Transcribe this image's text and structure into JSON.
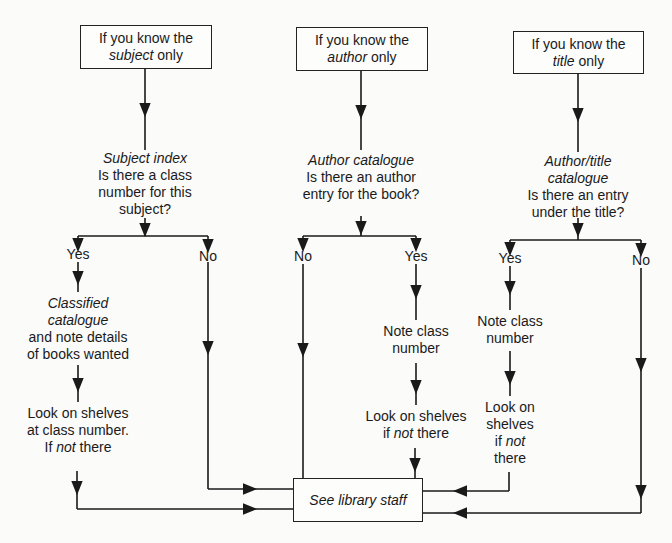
{
  "diagram": {
    "type": "flowchart",
    "start_nodes": [
      {
        "id": "subject",
        "line1": "If you know the",
        "emph": "subject",
        "rest": " only"
      },
      {
        "id": "author",
        "line1": "If you know the",
        "emph": "author",
        "rest": " only"
      },
      {
        "id": "title",
        "line1": "If you know the",
        "emph": "title",
        "rest": " only"
      }
    ],
    "questions": [
      {
        "id": "subject-index",
        "heading": "Subject index",
        "lines": [
          "Is there a class",
          "number for this",
          "subject?"
        ]
      },
      {
        "id": "author-catalogue",
        "heading": "Author catalogue",
        "lines": [
          "Is there an author",
          "entry for the book?"
        ]
      },
      {
        "id": "author-title-catalogue",
        "heading": [
          "Author/title",
          "catalogue"
        ],
        "lines": [
          "Is there an entry",
          "under the title?"
        ]
      }
    ],
    "branch_labels": {
      "yes": "Yes",
      "no": "No"
    },
    "steps": {
      "subject_yes_1": {
        "heading": [
          "Classified",
          "catalogue"
        ],
        "lines": [
          "and note details",
          "of books wanted"
        ]
      },
      "subject_yes_2": {
        "lines": [
          "Look on shelves",
          "at class number."
        ],
        "if": "If ",
        "not": "not",
        "there": " there"
      },
      "author_yes_1": {
        "lines": [
          "Note class",
          "number"
        ]
      },
      "author_yes_2": {
        "lines": [
          "Look on shelves"
        ],
        "if": "if ",
        "not": "not",
        "there": " there"
      },
      "title_yes_1": {
        "lines": [
          "Note class",
          "number"
        ]
      },
      "title_yes_2": {
        "lines": [
          "Look on",
          "shelves"
        ],
        "if": "if ",
        "not": "not",
        "last": "there"
      }
    },
    "end_node": {
      "id": "see-staff",
      "label": "See library staff"
    },
    "colors": {
      "line": "#1a1a1a",
      "background": "#fbfbfa"
    }
  }
}
